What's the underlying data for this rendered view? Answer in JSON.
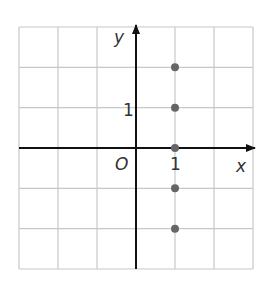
{
  "chart_data": {
    "type": "scatter",
    "title": "",
    "xlabel": "x",
    "ylabel": "y",
    "origin_label": "O",
    "xlim": [
      -3,
      3
    ],
    "ylim": [
      -3,
      3
    ],
    "grid": true,
    "tick_labels": {
      "x": [
        "1"
      ],
      "y": [
        "1"
      ]
    },
    "series": [
      {
        "name": "points",
        "x": [
          1,
          1,
          1,
          1,
          1
        ],
        "y": [
          2,
          1,
          0,
          -1,
          -2
        ]
      }
    ],
    "colors": {
      "grid": "#c8c8c8",
      "axis": "#111111",
      "point": "#666666"
    }
  }
}
